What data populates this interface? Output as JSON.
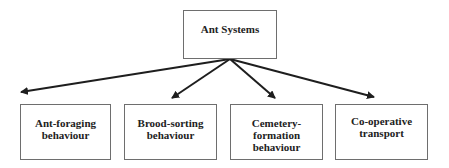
{
  "diagram": {
    "root": {
      "label": "Ant Systems"
    },
    "children": [
      {
        "label": "Ant-foraging\nbehaviour"
      },
      {
        "label": "Brood-sorting\nbehaviour"
      },
      {
        "label": "Cemetery-\nformation\nbehaviour"
      },
      {
        "label": "Co-operative\ntransport"
      }
    ],
    "edges": [
      {
        "from": "root",
        "to": 0
      },
      {
        "from": "root",
        "to": 1
      },
      {
        "from": "root",
        "to": 2
      },
      {
        "from": "root",
        "to": 3
      }
    ],
    "colors": {
      "line": "#1e1e1e",
      "border": "#6e6e6e",
      "text": "#222222"
    }
  }
}
